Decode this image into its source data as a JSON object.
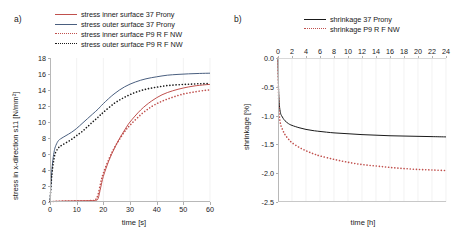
{
  "figure": {
    "panel_a_letter": "a)",
    "panel_b_letter": "b)"
  },
  "colors": {
    "red": "#c0504d",
    "blue": "#4a5f7f",
    "black": "#1a1a1a",
    "grid": "#ececec",
    "axis": "#b8b8b8"
  },
  "chart_data": [
    {
      "type": "line",
      "panel": "a)",
      "title": "",
      "xlabel": "time [s]",
      "ylabel": "stress in x-direction s11 [N/mm²]",
      "xlim": [
        0,
        60
      ],
      "ylim": [
        0,
        18
      ],
      "xticks": [
        0,
        10,
        20,
        30,
        40,
        50,
        60
      ],
      "yticks": [
        0,
        2,
        4,
        6,
        8,
        10,
        12,
        14,
        16,
        18
      ],
      "grid": "vertical",
      "legend_position": "top",
      "series": [
        {
          "name": "stress inner surface 37 Prony",
          "color": "#c0504d",
          "style": "solid",
          "x": [
            0,
            2,
            4,
            6,
            8,
            10,
            12,
            14,
            16,
            17,
            18,
            19,
            20,
            22,
            24,
            26,
            28,
            30,
            34,
            38,
            42,
            46,
            50,
            54,
            58,
            60
          ],
          "y": [
            0.05,
            0.08,
            0.1,
            0.12,
            0.13,
            0.14,
            0.15,
            0.16,
            0.18,
            0.2,
            0.4,
            1.8,
            3.2,
            5.1,
            6.6,
            7.9,
            9.0,
            10.0,
            11.5,
            12.6,
            13.4,
            13.9,
            14.25,
            14.5,
            14.65,
            14.7
          ]
        },
        {
          "name": "stress outer surface 37 Prony",
          "color": "#4a5f7f",
          "style": "solid",
          "x": [
            0,
            0.5,
            1,
            1.5,
            2,
            3,
            4,
            6,
            8,
            10,
            12,
            14,
            16,
            18,
            20,
            24,
            28,
            32,
            36,
            40,
            44,
            48,
            52,
            56,
            60
          ],
          "y": [
            0,
            3.0,
            5.0,
            6.2,
            6.9,
            7.6,
            7.9,
            8.3,
            8.7,
            9.2,
            9.8,
            10.4,
            11.0,
            11.6,
            12.3,
            13.5,
            14.4,
            15.0,
            15.4,
            15.65,
            15.85,
            15.95,
            16.02,
            16.07,
            16.1
          ]
        },
        {
          "name": "stress inner surface P9 R F NW",
          "color": "#c0504d",
          "style": "dotted",
          "x": [
            0,
            2,
            4,
            6,
            8,
            10,
            12,
            14,
            16,
            17,
            18,
            19,
            20,
            22,
            24,
            26,
            28,
            30,
            34,
            38,
            42,
            46,
            50,
            54,
            58,
            60
          ],
          "y": [
            0.05,
            0.08,
            0.1,
            0.12,
            0.13,
            0.14,
            0.15,
            0.16,
            0.18,
            0.25,
            0.9,
            2.4,
            3.6,
            5.3,
            6.7,
            7.8,
            8.8,
            9.6,
            10.9,
            11.9,
            12.6,
            13.1,
            13.5,
            13.75,
            13.95,
            14.0
          ]
        },
        {
          "name": "stress outer surface P9 R F NW",
          "color": "#1a1a1a",
          "style": "dotted",
          "x": [
            0,
            0.5,
            1,
            1.5,
            2,
            3,
            4,
            6,
            8,
            10,
            12,
            14,
            16,
            18,
            20,
            24,
            28,
            32,
            36,
            40,
            44,
            48,
            52,
            56,
            60
          ],
          "y": [
            0,
            2.6,
            4.3,
            5.4,
            6.1,
            6.7,
            7.0,
            7.4,
            7.8,
            8.3,
            8.8,
            9.4,
            10.0,
            10.6,
            11.2,
            12.3,
            13.1,
            13.7,
            14.1,
            14.35,
            14.55,
            14.65,
            14.72,
            14.78,
            14.8
          ]
        }
      ]
    },
    {
      "type": "line",
      "panel": "b)",
      "title": "",
      "xlabel": "time [h]",
      "ylabel": "shrinkage [%]",
      "xlim": [
        0,
        24
      ],
      "ylim": [
        -2.5,
        0.0
      ],
      "xticks": [
        0,
        2,
        4,
        6,
        8,
        10,
        12,
        14,
        16,
        18,
        20,
        22,
        24
      ],
      "yticks": [
        0.0,
        -0.5,
        -1.0,
        -1.5,
        -2.0,
        -2.5
      ],
      "ytick_labels": [
        "0.0",
        "-0.5",
        "-1.0",
        "-1.5",
        "-2.0",
        "-2.5"
      ],
      "grid": "vertical",
      "xaxis_position": "top",
      "legend_position": "top",
      "series": [
        {
          "name": "shrinkage 37 Prony",
          "color": "#1a1a1a",
          "style": "solid",
          "x": [
            0,
            0.05,
            0.1,
            0.2,
            0.35,
            0.5,
            0.75,
            1,
            1.5,
            2,
            3,
            4,
            5,
            6,
            8,
            10,
            12,
            14,
            16,
            18,
            20,
            22,
            24
          ],
          "y": [
            0.0,
            -0.35,
            -0.6,
            -0.82,
            -0.95,
            -1.0,
            -1.05,
            -1.09,
            -1.14,
            -1.17,
            -1.21,
            -1.24,
            -1.26,
            -1.275,
            -1.3,
            -1.315,
            -1.33,
            -1.34,
            -1.35,
            -1.355,
            -1.36,
            -1.365,
            -1.37
          ]
        },
        {
          "name": "shrinkage P9 R F NW",
          "color": "#c0504d",
          "style": "dotted",
          "x": [
            0,
            0.05,
            0.1,
            0.2,
            0.35,
            0.5,
            0.75,
            1,
            1.5,
            2,
            3,
            4,
            5,
            6,
            8,
            10,
            12,
            14,
            16,
            18,
            20,
            22,
            24
          ],
          "y": [
            0.0,
            -0.45,
            -0.75,
            -1.0,
            -1.14,
            -1.2,
            -1.27,
            -1.33,
            -1.41,
            -1.47,
            -1.55,
            -1.61,
            -1.66,
            -1.7,
            -1.76,
            -1.81,
            -1.85,
            -1.875,
            -1.9,
            -1.92,
            -1.935,
            -1.945,
            -1.955
          ]
        }
      ]
    }
  ]
}
